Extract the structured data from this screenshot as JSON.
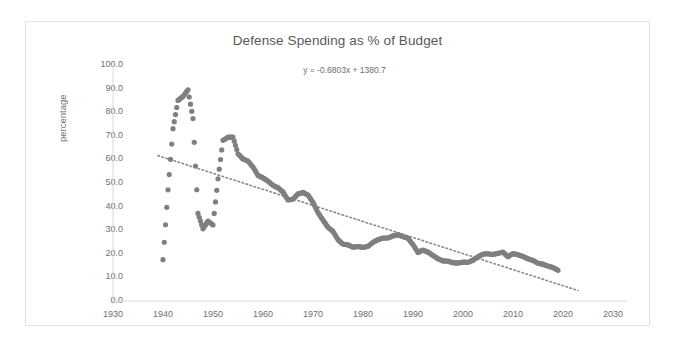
{
  "chart_data": {
    "type": "scatter",
    "title": "Defense Spending as % of Budget",
    "annotation": "y = -0.6803x + 1380.7",
    "xlabel": "",
    "ylabel": "percentage",
    "xlim": [
      1930,
      2030
    ],
    "ylim": [
      0.0,
      100.0
    ],
    "xticks": [
      "1930",
      "1940",
      "1950",
      "1960",
      "1970",
      "1980",
      "1990",
      "2000",
      "2010",
      "2020",
      "2030"
    ],
    "yticks": [
      "0.0",
      "10.0",
      "20.0",
      "30.0",
      "40.0",
      "50.0",
      "60.0",
      "70.0",
      "80.0",
      "90.0",
      "100.0"
    ],
    "grid": false,
    "legend": false,
    "marker_color": "#7f7f7f",
    "trendline": {
      "slope": -0.6803,
      "intercept": 1380.7,
      "style": "dotted",
      "color": "#8c8c8c",
      "x_start": 1939,
      "x_end": 2023
    },
    "series": [
      {
        "name": "Defense Spending as % of Budget",
        "x": [
          1940.0,
          1941.0,
          1942.0,
          1943.0,
          1944.0,
          1945.0,
          1946.0,
          1947.0,
          1948.0,
          1949.0,
          1950.0,
          1951.0,
          1952.0,
          1953.0,
          1954.0,
          1955.0,
          1956.0,
          1957.0,
          1958.0,
          1959.0,
          1960.0,
          1961.0,
          1962.0,
          1963.0,
          1964.0,
          1965.0,
          1966.0,
          1967.0,
          1968.0,
          1969.0,
          1970.0,
          1971.0,
          1972.0,
          1973.0,
          1974.0,
          1975.0,
          1976.0,
          1977.0,
          1978.0,
          1979.0,
          1980.0,
          1981.0,
          1982.0,
          1983.0,
          1984.0,
          1985.0,
          1986.0,
          1987.0,
          1988.0,
          1989.0,
          1990.0,
          1991.0,
          1992.0,
          1993.0,
          1994.0,
          1995.0,
          1996.0,
          1997.0,
          1998.0,
          1999.0,
          2000.0,
          2001.0,
          2002.0,
          2003.0,
          2004.0,
          2005.0,
          2006.0,
          2007.0,
          2008.0,
          2009.0,
          2010.0,
          2011.0,
          2012.0,
          2013.0,
          2014.0,
          2015.0,
          2016.0,
          2017.0,
          2018.0,
          2019.0
        ],
        "y": [
          17.5,
          47.1,
          73.0,
          85.0,
          86.7,
          89.5,
          77.3,
          37.1,
          30.6,
          33.9,
          32.2,
          51.8,
          68.1,
          69.4,
          69.5,
          62.4,
          60.2,
          59.3,
          56.8,
          53.2,
          52.2,
          50.8,
          49.0,
          48.0,
          46.2,
          42.8,
          43.2,
          45.4,
          46.0,
          44.9,
          41.8,
          37.5,
          34.3,
          31.2,
          29.5,
          26.0,
          24.1,
          23.8,
          22.8,
          23.1,
          22.7,
          23.2,
          24.9,
          26.0,
          26.7,
          26.7,
          27.6,
          28.1,
          27.3,
          26.6,
          23.9,
          20.6,
          21.6,
          20.7,
          19.3,
          17.9,
          17.0,
          16.9,
          16.2,
          16.1,
          16.5,
          16.4,
          17.3,
          18.7,
          19.9,
          20.0,
          19.7,
          20.2,
          20.7,
          18.8,
          20.1,
          19.6,
          18.9,
          17.9,
          17.2,
          16.0,
          15.6,
          14.8,
          14.2,
          13.0
        ]
      }
    ]
  },
  "title": "Defense Spending as % of Budget",
  "equation": "y = -0.6803x + 1380.7",
  "y_axis_title": "percentage"
}
